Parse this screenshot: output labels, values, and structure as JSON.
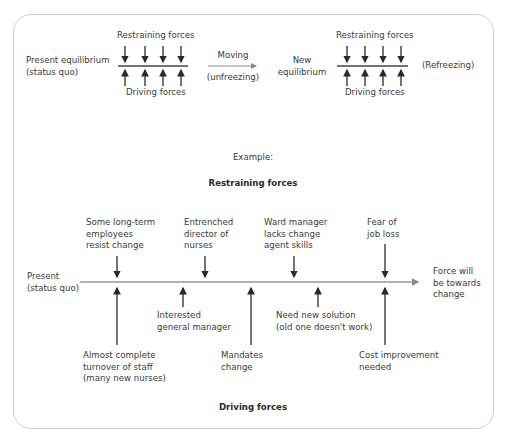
{
  "top": {
    "present": [
      "Present equilibrium",
      "(status quo)"
    ],
    "restraining_left": "Restraining forces",
    "driving_left": "Driving forces",
    "moving": "Moving",
    "unfreezing": "(unfreezing)",
    "new_eq": [
      "New",
      "equilibrium"
    ],
    "restraining_right": "Restraining forces",
    "driving_right": "Driving forces",
    "refreezing": "(Refreezing)"
  },
  "example": {
    "label": "Example:",
    "restraining_title": "Restraining forces",
    "driving_title": "Driving forces",
    "present": [
      "Present",
      "(status quo)"
    ],
    "outcome": [
      "Force will",
      "be towards",
      "change"
    ],
    "restraining": [
      {
        "lines": [
          "Some long-term",
          "employees",
          "resist change"
        ]
      },
      {
        "lines": [
          "Entrenched",
          "director of",
          "nurses"
        ]
      },
      {
        "lines": [
          "Ward manager",
          "lacks change",
          "agent skills"
        ]
      },
      {
        "lines": [
          "Fear of",
          "job loss"
        ]
      }
    ],
    "driving": [
      {
        "lines": [
          "Almost complete",
          "turnover of staff",
          "(many new nurses)"
        ]
      },
      {
        "lines": [
          "Interested",
          "general manager"
        ]
      },
      {
        "lines": [
          "Mandates",
          "change"
        ]
      },
      {
        "lines": [
          "Need new solution",
          "(old one doesn't work)"
        ]
      },
      {
        "lines": [
          "Cost improvement",
          "needed"
        ]
      }
    ]
  }
}
